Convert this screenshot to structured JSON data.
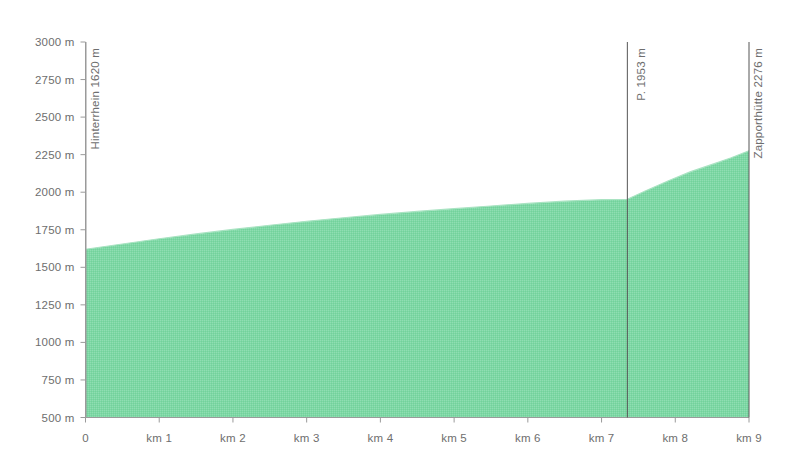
{
  "chart_data": {
    "type": "area",
    "title": "",
    "subtitle": "",
    "xlabel": "",
    "ylabel": "",
    "xlim": [
      0,
      9
    ],
    "ylim": [
      500,
      3000
    ],
    "grid": false,
    "legend": "none",
    "x_unit": "km",
    "y_unit": "m",
    "fill_color": "#7ed7a5",
    "line_color": "#8ed9ae",
    "axis_color": "#9a9a9a",
    "tick_label_color": "#6e6e6e",
    "marker_line_color": "#555555",
    "x_ticks": [
      {
        "value": 0,
        "label": "0"
      },
      {
        "value": 1,
        "label": "km 1"
      },
      {
        "value": 2,
        "label": "km 2"
      },
      {
        "value": 3,
        "label": "km 3"
      },
      {
        "value": 4,
        "label": "km 4"
      },
      {
        "value": 5,
        "label": "km 5"
      },
      {
        "value": 6,
        "label": "km 6"
      },
      {
        "value": 7,
        "label": "km 7"
      },
      {
        "value": 8,
        "label": "km 8"
      },
      {
        "value": 9,
        "label": "km 9"
      }
    ],
    "y_ticks": [
      {
        "value": 3000,
        "label": "3000 m"
      },
      {
        "value": 2750,
        "label": "2750 m"
      },
      {
        "value": 2500,
        "label": "2500 m"
      },
      {
        "value": 2250,
        "label": "2250 m"
      },
      {
        "value": 2000,
        "label": "2000 m"
      },
      {
        "value": 1750,
        "label": "1750 m"
      },
      {
        "value": 1500,
        "label": "1500 m"
      },
      {
        "value": 1250,
        "label": "1250 m"
      },
      {
        "value": 1000,
        "label": "1000 m"
      },
      {
        "value": 750,
        "label": "750 m"
      },
      {
        "value": 500,
        "label": "500 m"
      }
    ],
    "x": [
      0.0,
      0.5,
      1.0,
      1.5,
      2.0,
      2.5,
      3.0,
      3.5,
      4.0,
      4.5,
      5.0,
      5.5,
      6.0,
      6.5,
      7.0,
      7.35,
      7.6,
      7.9,
      8.2,
      8.5,
      8.75,
      9.0
    ],
    "values": [
      1620,
      1655,
      1690,
      1722,
      1752,
      1780,
      1806,
      1830,
      1852,
      1872,
      1890,
      1908,
      1925,
      1940,
      1950,
      1953,
      2010,
      2075,
      2135,
      2185,
      2228,
      2276
    ],
    "annotations": [
      {
        "name": "hinterrhein",
        "x": 0.0,
        "elevation": 2276,
        "label": "Hinterrhein  1620 m"
      },
      {
        "name": "punkt-1953",
        "x": 7.35,
        "elevation": 1953,
        "label": "P. 1953 m"
      },
      {
        "name": "zapporthuette",
        "x": 9.0,
        "elevation": 2276,
        "label": "Zapporthütte  2276 m"
      }
    ]
  },
  "markers": [
    {
      "id": "hinterrhein",
      "label": "Hinterrhein  1620 m"
    },
    {
      "id": "punkt-1953",
      "label": "P. 1953 m"
    },
    {
      "id": "zapporthuette",
      "label": "Zapporthütte  2276 m"
    }
  ]
}
